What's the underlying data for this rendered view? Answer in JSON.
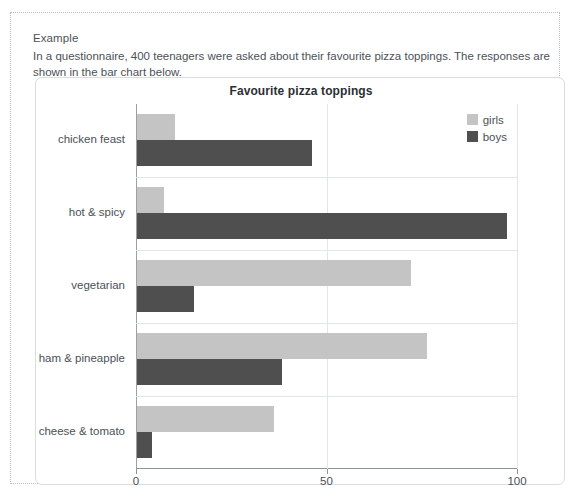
{
  "page": {
    "heading": "Example",
    "intro": "In a questionnaire, 400 teenagers were asked about their favourite pizza toppings. The responses are shown in the bar chart below."
  },
  "chart_data": {
    "type": "bar",
    "orientation": "horizontal",
    "title": "Favourite pizza toppings",
    "xlabel": "number of teenagers",
    "ylabel": "",
    "xlim": [
      0,
      100
    ],
    "xticks": [
      "0",
      "50",
      "100"
    ],
    "xtick_values": [
      0,
      50,
      100
    ],
    "grid": "vertical",
    "legend_position": "top-right",
    "categories": [
      "chicken feast",
      "hot & spicy",
      "vegetarian",
      "ham & pineapple",
      "cheese & tomato"
    ],
    "series": [
      {
        "name": "girls",
        "color": "#c4c4c4",
        "values": [
          10,
          7,
          72,
          76,
          36
        ]
      },
      {
        "name": "boys",
        "color": "#4f4f4f",
        "values": [
          46,
          97,
          15,
          38,
          4
        ]
      }
    ]
  },
  "colors": {
    "girls": "#c4c4c4",
    "boys": "#4f4f4f",
    "text": "#4b5157",
    "gridline": "#e3e6e9",
    "axis": "#8d9398",
    "card_border": "#d9dde1",
    "frame_border": "#b8bcc2"
  }
}
